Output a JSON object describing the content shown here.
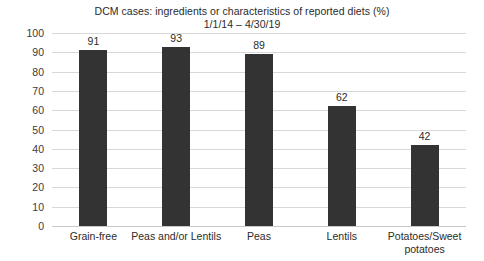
{
  "chart_data": {
    "type": "bar",
    "title": "DCM cases: ingredients or characteristics of reported diets (%)",
    "subtitle": "1/1/14 – 4/30/19",
    "title_lines": [
      "DCM cases: ingredients or characteristics of reported diets (%)",
      "1/1/14 – 4/30/19"
    ],
    "categories": [
      "Grain-free",
      "Peas and/or Lentils",
      "Peas",
      "Lentils",
      "Potatoes/Sweet potatoes"
    ],
    "category_lines": [
      [
        "Grain-free"
      ],
      [
        "Peas and/or Lentils"
      ],
      [
        "Peas"
      ],
      [
        "Lentils"
      ],
      [
        "Potatoes/Sweet",
        "potatoes"
      ]
    ],
    "values": [
      91,
      93,
      89,
      62,
      42
    ],
    "value_labels": [
      "91",
      "93",
      "89",
      "62",
      "42"
    ],
    "xlabel": "",
    "ylabel": "",
    "ylim": [
      0,
      100
    ],
    "ytick_step": 10,
    "ytick_labels": [
      "100",
      "90",
      "80",
      "70",
      "60",
      "50",
      "40",
      "30",
      "20",
      "10",
      "0"
    ],
    "ytick_values": [
      100,
      90,
      80,
      70,
      60,
      50,
      40,
      30,
      20,
      10,
      0
    ],
    "grid": true,
    "legend": false,
    "legend_position": "none",
    "colors": {
      "bar": "#333333",
      "gridline": "#d8d8d8",
      "baseline": "#c9c9c9",
      "text": "#2b2b2b",
      "background": "#ffffff"
    }
  }
}
